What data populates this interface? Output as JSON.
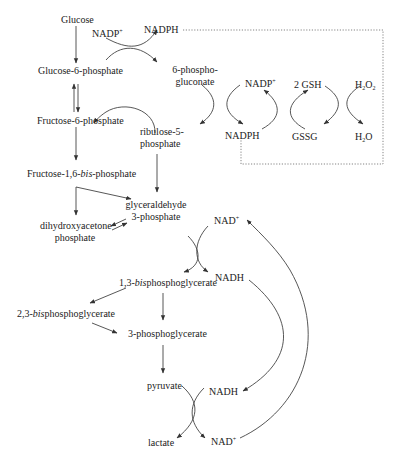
{
  "diagram": {
    "type": "metabolic-pathway",
    "colors": {
      "text": "#222222",
      "line": "#444444",
      "dotted": "#777777",
      "background": "#ffffff"
    },
    "nodes": {
      "glucose": "Glucose",
      "g6p": "Glucose-6-phosphate",
      "f6p": "Fructose-6-phosphate",
      "f16bp_pre": "Fructose-1,6-",
      "f16bp_ital": "bis",
      "f16bp_post": "-phosphate",
      "pgluconate_l1": "6-phospho-",
      "pgluconate_l2": "gluconate",
      "ru5p_l1": "ribulose-5-",
      "ru5p_l2": "phosphate",
      "g3p_l1": "glyceraldehyde",
      "g3p_l2": "3-phosphate",
      "dhap_l1": "dihydroxyacetone",
      "dhap_l2": "phosphate",
      "bpg13_pre": "1,3-",
      "bpg13_ital": "bis",
      "bpg13_post": "phosphoglycerate",
      "bpg23_pre": "2,3-",
      "bpg23_ital": "bis",
      "bpg23_post": "phosphoglycerate",
      "pg3": "3-phosphoglycerate",
      "pyruvate": "pyruvate",
      "lactate": "lactate"
    },
    "cofactors": {
      "nadp_plus_top": {
        "base": "NADP",
        "sup": "+"
      },
      "nadph_top": "NADPH",
      "nadp_plus_cycle": {
        "base": "NADP",
        "sup": "+"
      },
      "nadph_cycle": "NADPH",
      "gsh": "2 GSH",
      "gssg": "GSSG",
      "h2o2": {
        "a": "H",
        "sub1": "2",
        "b": "O",
        "sub2": "2"
      },
      "h2o": {
        "a": "H",
        "sub1": "2",
        "b": "O"
      },
      "nad_plus_upper": {
        "base": "NAD",
        "sup": "+"
      },
      "nadh_upper": "NADH",
      "nadh_lower": "NADH",
      "nad_plus_lower": {
        "base": "NAD",
        "sup": "+"
      }
    }
  }
}
